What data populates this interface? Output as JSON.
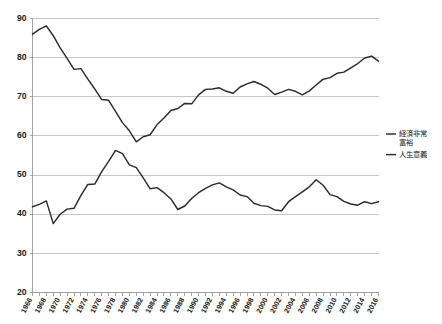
{
  "chart_data": {
    "type": "line",
    "title": "",
    "subtitle": "",
    "xlabel": "",
    "ylabel": "",
    "xlim": [
      1966,
      2016
    ],
    "ylim": [
      20,
      90
    ],
    "grid": true,
    "legend_position": "right",
    "y_ticks": [
      20,
      30,
      40,
      50,
      60,
      70,
      80,
      90
    ],
    "x_ticks": [
      1966,
      1968,
      1970,
      1972,
      1974,
      1976,
      1978,
      1980,
      1982,
      1984,
      1986,
      1988,
      1990,
      1992,
      1994,
      1996,
      1998,
      2000,
      2002,
      2004,
      2006,
      2008,
      2010,
      2012,
      2014,
      2016
    ],
    "x": [
      1966,
      1967,
      1968,
      1969,
      1970,
      1971,
      1972,
      1973,
      1974,
      1975,
      1976,
      1977,
      1978,
      1979,
      1980,
      1981,
      1982,
      1983,
      1984,
      1985,
      1986,
      1987,
      1988,
      1989,
      1990,
      1991,
      1992,
      1993,
      1994,
      1995,
      1996,
      1997,
      1998,
      1999,
      2000,
      2001,
      2002,
      2003,
      2004,
      2005,
      2006,
      2007,
      2008,
      2009,
      2010,
      2011,
      2012,
      2013,
      2014,
      2015,
      2016
    ],
    "series": [
      {
        "name": "経済非常富裕",
        "color": "#2b2b2b",
        "values": [
          41.9,
          42.5,
          43.4,
          37.6,
          40.0,
          41.3,
          41.5,
          44.8,
          47.6,
          47.7,
          50.9,
          53.5,
          56.3,
          55.5,
          52.6,
          51.9,
          49.3,
          46.5,
          46.8,
          45.5,
          43.9,
          41.2,
          42.1,
          44.0,
          45.5,
          46.6,
          47.5,
          48.0,
          47.0,
          46.2,
          44.9,
          44.5,
          42.8,
          42.2,
          42.0,
          41.1,
          40.9,
          43.2,
          44.5,
          45.7,
          47.0,
          48.8,
          47.4,
          45.0,
          44.5,
          43.3,
          42.6,
          42.3,
          43.2,
          42.7,
          43.2
        ]
      },
      {
        "name": "人生意義",
        "color": "#2b2b2b",
        "values": [
          86.0,
          87.2,
          88.1,
          85.6,
          82.5,
          79.8,
          77.0,
          77.2,
          74.5,
          72.0,
          69.3,
          69.1,
          66.3,
          63.4,
          61.3,
          58.5,
          59.8,
          60.3,
          62.9,
          64.6,
          66.5,
          67.0,
          68.3,
          68.2,
          70.5,
          71.9,
          72.0,
          72.3,
          71.4,
          70.9,
          72.5,
          73.3,
          73.9,
          73.2,
          72.2,
          70.6,
          71.2,
          71.9,
          71.4,
          70.5,
          71.5,
          73.0,
          74.5,
          74.9,
          76.0,
          76.3,
          77.4,
          78.5,
          79.9,
          80.4,
          79.1
        ]
      }
    ]
  },
  "legend": {
    "entries": [
      {
        "lines": [
          "経済非常",
          "富裕"
        ]
      },
      {
        "lines": [
          "人生意義"
        ]
      }
    ]
  }
}
